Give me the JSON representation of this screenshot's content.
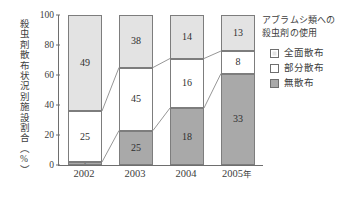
{
  "chart_data": {
    "type": "bar",
    "subtype": "stacked-bar-100-percent",
    "title": "",
    "xlabel": "",
    "ylabel": "殺虫剤散布状況別施設割合（%）",
    "categories": [
      "2002",
      "2003",
      "2004",
      "2005年"
    ],
    "ylim": [
      0,
      100
    ],
    "yticks": [
      0,
      20,
      40,
      60,
      80,
      100
    ],
    "ytick_labels": [
      "0",
      "20",
      "40",
      "60",
      "80",
      "100"
    ],
    "grid": false,
    "legend_position": "right",
    "legend_title": "アブラムシ類への殺虫剤の使用",
    "series": [
      {
        "name": "全面散布",
        "color": "#e3e3e3",
        "values": [
          49,
          38,
          14,
          13
        ],
        "stack_top": [
          100,
          100,
          100,
          100
        ],
        "stack_bottom": [
          36,
          65,
          71,
          76
        ]
      },
      {
        "name": "部分散布",
        "color": "#ffffff",
        "values": [
          25,
          45,
          16,
          8
        ],
        "stack_top": [
          36,
          65,
          71,
          76
        ],
        "stack_bottom": [
          2,
          23,
          38,
          61
        ]
      },
      {
        "name": "無散布",
        "color": "#a9a9a9",
        "values": [
          2,
          25,
          18,
          33
        ],
        "stack_top": [
          2,
          23,
          38,
          61
        ],
        "stack_bottom": [
          0,
          0,
          0,
          0
        ]
      }
    ]
  },
  "axis": {
    "y_title": "殺虫剤散布状況別施設割合（%）",
    "y_ticks": [
      {
        "value": 100,
        "label": "100"
      },
      {
        "value": 80,
        "label": "80"
      },
      {
        "value": 60,
        "label": "60"
      },
      {
        "value": 40,
        "label": "40"
      },
      {
        "value": 20,
        "label": "20"
      },
      {
        "value": 0,
        "label": "0"
      }
    ],
    "x_ticks": [
      {
        "label": "2002",
        "unit": ""
      },
      {
        "label": "2003",
        "unit": ""
      },
      {
        "label": "2004",
        "unit": ""
      },
      {
        "label": "2005",
        "unit": "年"
      }
    ]
  },
  "bars": [
    {
      "category": "2002",
      "segments": [
        {
          "series": "全面散布",
          "label": "49",
          "value": 49,
          "top": 100,
          "bottom": 36,
          "fill": "fill-full"
        },
        {
          "series": "部分散布",
          "label": "25",
          "value": 25,
          "top": 36,
          "bottom": 2,
          "fill": "fill-partial"
        },
        {
          "series": "無散布",
          "label": "2",
          "value": 2,
          "top": 2,
          "bottom": 0,
          "fill": "fill-none"
        }
      ]
    },
    {
      "category": "2003",
      "segments": [
        {
          "series": "全面散布",
          "label": "38",
          "value": 38,
          "top": 100,
          "bottom": 65,
          "fill": "fill-full"
        },
        {
          "series": "部分散布",
          "label": "45",
          "value": 45,
          "top": 65,
          "bottom": 23,
          "fill": "fill-partial"
        },
        {
          "series": "無散布",
          "label": "25",
          "value": 25,
          "top": 23,
          "bottom": 0,
          "fill": "fill-none"
        }
      ]
    },
    {
      "category": "2004",
      "segments": [
        {
          "series": "全面散布",
          "label": "14",
          "value": 14,
          "top": 100,
          "bottom": 71,
          "fill": "fill-full"
        },
        {
          "series": "部分散布",
          "label": "16",
          "value": 16,
          "top": 71,
          "bottom": 38,
          "fill": "fill-partial"
        },
        {
          "series": "無散布",
          "label": "18",
          "value": 18,
          "top": 38,
          "bottom": 0,
          "fill": "fill-none"
        }
      ]
    },
    {
      "category": "2005年",
      "segments": [
        {
          "series": "全面散布",
          "label": "13",
          "value": 13,
          "top": 100,
          "bottom": 76,
          "fill": "fill-full"
        },
        {
          "series": "部分散布",
          "label": "8",
          "value": 8,
          "top": 76,
          "bottom": 61,
          "fill": "fill-partial"
        },
        {
          "series": "無散布",
          "label": "33",
          "value": 33,
          "top": 61,
          "bottom": 0,
          "fill": "fill-none"
        }
      ]
    }
  ],
  "legend": {
    "title_line1": "アブラムシ類への",
    "title_line2": "殺虫剤の使用",
    "items": [
      {
        "label": "全面散布",
        "color": "#e3e3e3",
        "style": "light"
      },
      {
        "label": "部分散布",
        "color": "#ffffff",
        "style": "white"
      },
      {
        "label": "無散布",
        "color": "#a9a9a9",
        "style": "dark"
      }
    ]
  },
  "colors": {
    "fill_full": "#e3e3e3",
    "fill_partial": "#ffffff",
    "fill_none": "#a9a9a9",
    "axis": "#6e6e6e",
    "text": "#3d3d3d",
    "connector": "#8a8a8a"
  }
}
